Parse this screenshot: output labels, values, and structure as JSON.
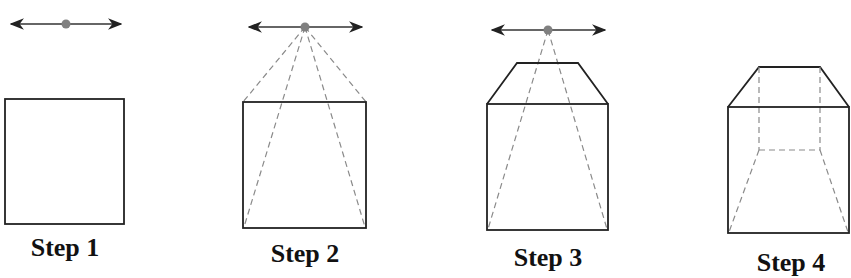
{
  "colors": {
    "line": "#222222",
    "dashed": "#8a8a8a",
    "vanishing_point": "#808080",
    "background": "#ffffff"
  },
  "steps": [
    {
      "label": "Step 1",
      "description": "Horizon line with vanishing point; front square drawn"
    },
    {
      "label": "Step 2",
      "description": "Orthogonal guide lines from corners to vanishing point"
    },
    {
      "label": "Step 3",
      "description": "Top face drawn as trapezoid"
    },
    {
      "label": "Step 4",
      "description": "Hidden back edges drawn as dashed lines"
    }
  ]
}
